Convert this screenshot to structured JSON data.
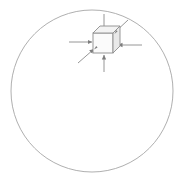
{
  "figure": {
    "title": "Hydrostatic compression of a cubic element",
    "canvas": {
      "width": 183,
      "height": 183,
      "background": "#ffffff"
    },
    "stroke_color": "#9a9a9a",
    "cube_face_color": "#fbfbfb",
    "cube_top_color": "#f4f4f4",
    "cube_side_color": "#ececec",
    "boundary_circle": {
      "label": "boundary-circle",
      "center_x": 92,
      "center_y": 91,
      "radius": 81,
      "stroke_width": 0.8,
      "fill": "none"
    },
    "cube": {
      "label": "cubic-element",
      "center_x": 103,
      "center_y": 42,
      "half_size": 10,
      "depth_offset_x": 7,
      "depth_offset_y": -7
    },
    "arrows": [
      {
        "id": "arrow-left",
        "direction": "right",
        "label": "compression-left",
        "angle_deg": 0,
        "length": 26
      },
      {
        "id": "arrow-right",
        "direction": "left",
        "label": "compression-right",
        "angle_deg": 180,
        "length": 26
      },
      {
        "id": "arrow-top",
        "direction": "down",
        "label": "compression-top",
        "angle_deg": 270,
        "length": 26
      },
      {
        "id": "arrow-bottom",
        "direction": "up",
        "label": "compression-bottom",
        "angle_deg": 90,
        "length": 26
      },
      {
        "id": "arrow-upper-right",
        "direction": "down-left",
        "label": "compression-upper-right",
        "angle_deg": 225,
        "length": 24
      },
      {
        "id": "arrow-lower-left",
        "direction": "up-right",
        "label": "compression-lower-left",
        "angle_deg": 45,
        "length": 24
      }
    ]
  },
  "chart_data": {
    "type": "diagram",
    "title": "Hydrostatic compression of a cubic element",
    "subtitle": "",
    "xlabel": "",
    "ylabel": "",
    "elements": [
      {
        "name": "boundary-circle",
        "shape": "circle",
        "cx": 92,
        "cy": 91,
        "r": 81,
        "stroke": "#9a9a9a",
        "fill": "none"
      },
      {
        "name": "cubic-element",
        "shape": "cube-isometric",
        "cx": 103,
        "cy": 42,
        "size": 20,
        "stroke": "#8c8c8c",
        "faces": [
          "front",
          "top",
          "right"
        ]
      },
      {
        "name": "arrow-left",
        "shape": "arrow",
        "from": [
          69,
          42
        ],
        "to": [
          92,
          42
        ],
        "head": "end"
      },
      {
        "name": "arrow-right",
        "shape": "arrow",
        "from": [
          142,
          45
        ],
        "to": [
          118,
          45
        ],
        "head": "end"
      },
      {
        "name": "arrow-top",
        "shape": "arrow",
        "from": [
          104,
          14
        ],
        "to": [
          104,
          32
        ],
        "head": "end"
      },
      {
        "name": "arrow-bottom",
        "shape": "arrow",
        "from": [
          104,
          72
        ],
        "to": [
          104,
          55
        ],
        "head": "end"
      },
      {
        "name": "arrow-upper-right",
        "shape": "arrow",
        "from": [
          128,
          20
        ],
        "to": [
          113,
          34
        ],
        "head": "end"
      },
      {
        "name": "arrow-lower-left",
        "shape": "arrow",
        "from": [
          78,
          63
        ],
        "to": [
          94,
          49
        ],
        "head": "end"
      }
    ],
    "annotations": [],
    "legend": [],
    "grid": false
  }
}
